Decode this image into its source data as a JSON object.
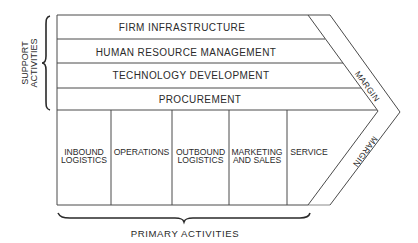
{
  "diagram": {
    "type": "value-chain",
    "support_activities": {
      "label_line1": "SUPPORT",
      "label_line2": "ACTIVITIES",
      "rows": [
        {
          "label": "FIRM INFRASTRUCTURE"
        },
        {
          "label": "HUMAN RESOURCE MANAGEMENT"
        },
        {
          "label": "TECHNOLOGY DEVELOPMENT"
        },
        {
          "label": "PROCUREMENT"
        }
      ]
    },
    "primary_activities": {
      "label": "PRIMARY ACTIVITIES",
      "columns": [
        {
          "line1": "INBOUND",
          "line2": "LOGISTICS"
        },
        {
          "line1": "OPERATIONS",
          "line2": ""
        },
        {
          "line1": "OUTBOUND",
          "line2": "LOGISTICS"
        },
        {
          "line1": "MARKETING",
          "line2": "AND SALES"
        },
        {
          "line1": "SERVICE",
          "line2": ""
        }
      ]
    },
    "margin_upper": "MARGIN",
    "margin_lower": "MARGIN"
  }
}
